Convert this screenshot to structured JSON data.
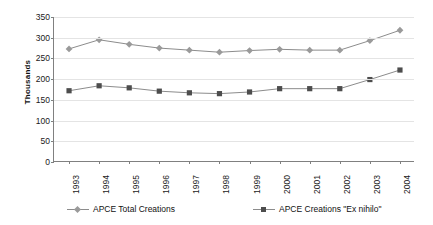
{
  "chart_data": {
    "type": "line",
    "title": "",
    "xlabel": "",
    "ylabel": "Thousands",
    "ylim": [
      0,
      350
    ],
    "ytick_step": 50,
    "yticks": [
      0,
      50,
      100,
      150,
      200,
      250,
      300,
      350
    ],
    "grid": true,
    "legend_position": "bottom",
    "categories": [
      "1993",
      "1994",
      "1995",
      "1996",
      "1997",
      "1998",
      "1999",
      "2000",
      "2001",
      "2002",
      "2003",
      "2004"
    ],
    "series": [
      {
        "name": "APCE Total Creations",
        "marker": "diamond",
        "color": "#9a9a9a",
        "line_color": "#8c8c8c",
        "values": [
          273,
          295,
          284,
          275,
          270,
          265,
          269,
          272,
          270,
          270,
          293,
          318
        ]
      },
      {
        "name": "APCE Creations \"Ex nihilo\"",
        "marker": "square",
        "color": "#4d4d4d",
        "line_color": "#8c8c8c",
        "values": [
          172,
          184,
          179,
          171,
          167,
          165,
          169,
          177,
          177,
          177,
          199,
          222
        ]
      }
    ]
  },
  "axes": {
    "y_title": "Thousands",
    "y_tick_labels": [
      "350",
      "300",
      "250",
      "200",
      "150",
      "100",
      "50",
      "0"
    ],
    "x_tick_labels": [
      "1993",
      "1994",
      "1995",
      "1996",
      "1997",
      "1998",
      "1999",
      "2000",
      "2001",
      "2002",
      "2003",
      "2004"
    ]
  },
  "legend": {
    "entries": [
      {
        "label": "APCE Total Creations"
      },
      {
        "label": "APCE Creations \"Ex nihilo\""
      }
    ]
  },
  "colors": {
    "series_1": "#9a9a9a",
    "series_2": "#4d4d4d",
    "line": "#8c8c8c",
    "axis": "#808080",
    "grid": "#e4e4e4",
    "text": "#1a1a1a",
    "background": "#ffffff"
  }
}
